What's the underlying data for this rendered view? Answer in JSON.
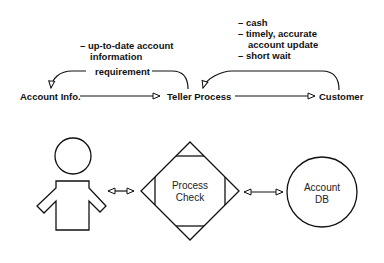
{
  "top_diagram": {
    "nodes": {
      "account_info": "Account Info.",
      "teller_process": "Teller Process",
      "customer": "Customer"
    },
    "left_notes": {
      "line1": "– up-to-date account",
      "line2": "information"
    },
    "left_arrow_label": "requirement",
    "right_notes": {
      "line1": "– cash",
      "line2": "– timely, accurate",
      "line3": "account update",
      "line4": "– short wait"
    }
  },
  "bottom_diagram": {
    "actor": "person",
    "process": {
      "line1": "Process",
      "line2": "Check"
    },
    "store": {
      "line1": "Account",
      "line2": "DB"
    }
  }
}
